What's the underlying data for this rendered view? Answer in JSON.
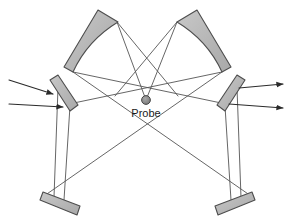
{
  "figure": {
    "type": "optical-beam-diagram",
    "background_color": "#ffffff",
    "width": 295,
    "height": 219
  },
  "labels": {
    "probe": "Probe"
  },
  "colors": {
    "mirror_fill": "#b9b9b9",
    "mirror_fill_light": "#c6c6c6",
    "mirror_stroke": "#4d4d4d",
    "beam_stroke": "#555555",
    "arrow_stroke": "#2b2b2b",
    "probe_fill": "#8a8a8a",
    "probe_stroke": "#3a3a3a",
    "label_color": "#1a1a1a"
  },
  "components": {
    "curved_mirror_left": {
      "name": "concave-mirror-left",
      "outline": "M 64,67 L 98,10 L 118,22 C 103,30 85,45 73,72 Z",
      "fill": "#b9b9b9"
    },
    "curved_mirror_right": {
      "name": "concave-mirror-right",
      "outline": "M 231,67 L 197,10 L 177,22 C 192,30 210,45 222,72 Z",
      "fill": "#b9b9b9"
    },
    "flat_mirror_mid_left": {
      "name": "flat-mirror-mid-left",
      "outline": "M 50,80 L 58,76 L 78,106 L 70,111 Z",
      "fill": "#b9b9b9"
    },
    "flat_mirror_mid_right": {
      "name": "flat-mirror-mid-right",
      "outline": "M 245,80 L 237,76 L 217,106 L 225,111 Z",
      "fill": "#b9b9b9"
    },
    "flat_mirror_bottom_left": {
      "name": "flat-mirror-bottom-left",
      "outline": "M 43,193 L 79,206 L 76,214 L 40,201 Z",
      "fill": "#b9b9b9"
    },
    "flat_mirror_bottom_right": {
      "name": "flat-mirror-bottom-right",
      "outline": "M 252,193 L 216,206 L 219,214 L 255,201 Z",
      "fill": "#b9b9b9"
    },
    "probe": {
      "name": "probe-sphere",
      "cx": 146,
      "cy": 100,
      "r": 4.2,
      "fill": "#8a8a8a"
    }
  },
  "beams": [
    {
      "name": "beam-left-top-to-probe",
      "d": "M 117,22 L 146,100"
    },
    {
      "name": "beam-left-top-cross-right",
      "d": "M 117,22 L 178,96"
    },
    {
      "name": "beam-right-top-to-probe",
      "d": "M 177,22 L 146,100"
    },
    {
      "name": "beam-right-top-cross-left",
      "d": "M 177,22 L 115,96"
    },
    {
      "name": "beam-left-bottom-to-right-mirror",
      "d": "M 73,72 L 226,104"
    },
    {
      "name": "beam-right-bottom-to-left-mirror",
      "d": "M 222,72 L 69,104"
    },
    {
      "name": "beam-left-bottom-long-diagonal",
      "d": "M 73,72 L 251,196"
    },
    {
      "name": "beam-right-bottom-long-diagonal",
      "d": "M 222,72 L 44,196"
    },
    {
      "name": "beam-midleft-down-a",
      "d": "M 58,88 L 54,197"
    },
    {
      "name": "beam-midleft-down-b",
      "d": "M 70,106 L 64,200"
    },
    {
      "name": "beam-midright-down-a",
      "d": "M 237,88 L 241,197"
    },
    {
      "name": "beam-midright-down-b",
      "d": "M 225,106 L 231,200"
    },
    {
      "name": "beam-bottomleft-up-to-probe-line",
      "d": "M 60,199 L 73,72"
    },
    {
      "name": "beam-bottomright-up-to-probe-line",
      "d": "M 235,199 L 222,72"
    }
  ],
  "rays": [
    {
      "name": "input-ray-upper",
      "d": "M 9,80 L 56,95",
      "arrow_at": [
        56,
        95
      ]
    },
    {
      "name": "input-ray-lower",
      "d": "M 9,104 L 66,107",
      "arrow_at": [
        66,
        107
      ]
    },
    {
      "name": "output-ray-upper",
      "d": "M 239,88 L 286,84",
      "arrow_at": [
        286,
        84
      ]
    },
    {
      "name": "output-ray-lower",
      "d": "M 229,104 L 286,108",
      "arrow_at": [
        286,
        108
      ]
    }
  ]
}
